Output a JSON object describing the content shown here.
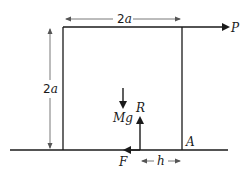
{
  "diagram": {
    "type": "free-body diagram",
    "object": "square block of side 2a on rough horizontal ground",
    "labels": {
      "width_num": "2",
      "width_var": "a",
      "height_num": "2",
      "height_var": "a",
      "applied_force": "P",
      "weight": "Mg",
      "normal_reaction": "R",
      "friction": "F",
      "pivot_corner": "A",
      "offset": "h"
    },
    "colors": {
      "stroke": "#1a1a1a",
      "dimension_line": "#555555"
    }
  }
}
